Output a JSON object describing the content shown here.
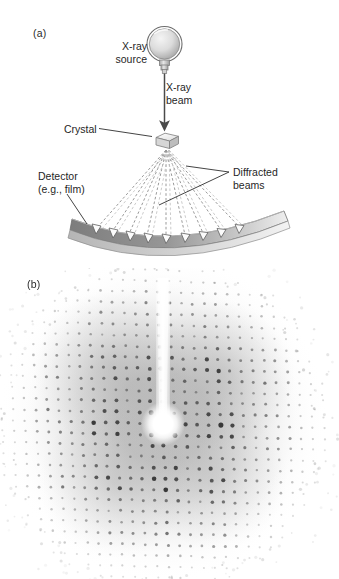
{
  "figure": {
    "background_color": "#ffffff"
  },
  "panel_a": {
    "label": "(a)",
    "annotations": {
      "xray_source": "X-ray\nsource",
      "xray_beam": "X-ray\nbeam",
      "crystal": "Crystal",
      "detector": "Detector\n(e.g., film)",
      "diffracted_beams": "Diffracted\nbeams"
    },
    "colors": {
      "line": "#4a4a4a",
      "detector_fill": "#8d8d8d",
      "detector_edge": "#c9c9c9",
      "source_fill": "#d8d8d8",
      "crystal_fill": "#e8e8e8",
      "beam_dash": "#9a9a9a"
    },
    "diffracted_beam_count": 9
  },
  "panel_b": {
    "label": "(b)",
    "description": "X-ray diffraction pattern with central direct beam and vertical beamstop shadow",
    "colors": {
      "spot": "#2b2b2b",
      "halo": "#9b9b9b",
      "beamstop": "#ffffff"
    },
    "center": {
      "x": 163,
      "y": 424
    },
    "beamstop": {
      "top_y": 278,
      "width": 9
    },
    "lattice": {
      "spacing_x": 11.5,
      "spacing_y": 11.0,
      "rows": 27,
      "cols": 27
    }
  }
}
